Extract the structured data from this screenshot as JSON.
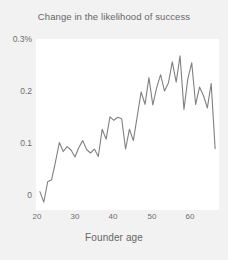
{
  "chart_data": {
    "type": "line",
    "title": "Change in the likelihood of success",
    "xlabel": "Founder age",
    "ylabel": "",
    "xlim": [
      19,
      66
    ],
    "ylim": [
      -0.035,
      0.31
    ],
    "grid": false,
    "legend": "none",
    "line_color": "#808080",
    "panel_color": "#ffffff",
    "background_color": "#f2f2f2",
    "x_ticks": [
      20,
      30,
      40,
      50,
      60
    ],
    "x_tick_labels": [
      "20",
      "30",
      "40",
      "50",
      "60"
    ],
    "y_ticks": [
      0,
      0.1,
      0.2,
      0.3
    ],
    "y_tick_labels": [
      "0",
      "0.1",
      "0.2",
      "0.3%"
    ],
    "units": "percent",
    "x": [
      20,
      21,
      22,
      23,
      24,
      25,
      26,
      27,
      28,
      29,
      30,
      31,
      32,
      33,
      34,
      35,
      36,
      37,
      38,
      39,
      40,
      41,
      42,
      43,
      44,
      45,
      46,
      47,
      48,
      49,
      50,
      51,
      52,
      53,
      54,
      55,
      56,
      57,
      58,
      59,
      60,
      61,
      62,
      63,
      64,
      65
    ],
    "y": [
      0.002,
      -0.019,
      0.022,
      0.026,
      0.062,
      0.101,
      0.083,
      0.093,
      0.086,
      0.072,
      0.091,
      0.105,
      0.087,
      0.08,
      0.088,
      0.073,
      0.128,
      0.108,
      0.153,
      0.146,
      0.152,
      0.149,
      0.088,
      0.128,
      0.105,
      0.154,
      0.203,
      0.178,
      0.232,
      0.177,
      0.212,
      0.238,
      0.205,
      0.221,
      0.264,
      0.223,
      0.276,
      0.168,
      0.23,
      0.262,
      0.178,
      0.213,
      0.196,
      0.171,
      0.22,
      0.089
    ]
  }
}
